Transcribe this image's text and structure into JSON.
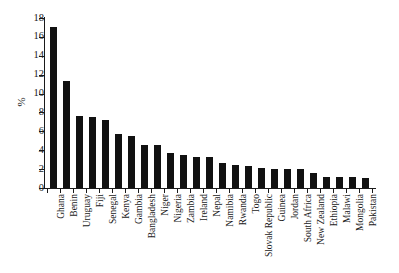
{
  "chart_data": {
    "type": "bar",
    "title": "",
    "subtitle": "",
    "xlabel": "",
    "ylabel": "%",
    "ylim": [
      0,
      18
    ],
    "ytick_step": 2,
    "yticks": [
      0,
      2,
      4,
      6,
      8,
      10,
      12,
      14,
      16,
      18
    ],
    "grid": false,
    "legend": null,
    "bar_color": "#111111",
    "axis_color": "#1a1a1a",
    "categories": [
      "Ghana",
      "Benin",
      "Uruguay",
      "Fiji",
      "Senegal",
      "Kenya",
      "Gambia",
      "Bangladesh",
      "Niger",
      "Nigeria",
      "Zambia",
      "Ireland",
      "Nepal",
      "Namibia",
      "Rwanda",
      "Togo",
      "Slovak Republic",
      "Guinea",
      "Jordan",
      "South Africa",
      "New Zealand",
      "Ethiopia",
      "Malawi",
      "Mongolia",
      "Pakistan"
    ],
    "values": [
      17.1,
      11.3,
      7.6,
      7.5,
      7.2,
      5.7,
      5.5,
      4.6,
      4.6,
      3.7,
      3.5,
      3.3,
      3.3,
      2.6,
      2.4,
      2.3,
      2.1,
      2.0,
      2.0,
      2.0,
      1.6,
      1.2,
      1.2,
      1.2,
      1.1
    ]
  }
}
